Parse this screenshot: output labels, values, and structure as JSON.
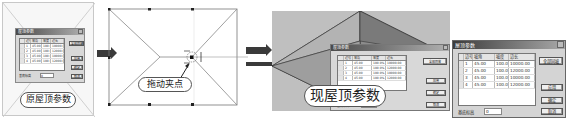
{
  "panel_original": {
    "caption": "原屋顶参数",
    "dialog": {
      "title": "屋顶参数",
      "columns": [
        "边号",
        "坡角",
        "坡度",
        "边长"
      ],
      "rows": [
        [
          "1",
          "45.00",
          "100.0%",
          "10000.00"
        ],
        [
          "2",
          "45.00",
          "100.0%",
          "12000.00"
        ],
        [
          "3",
          "45.00",
          "100.0%",
          "10000.00"
        ],
        [
          "4",
          "45.00",
          "100.0%",
          "12000.00"
        ]
      ],
      "buttons": [
        "全部同坡",
        "应用",
        "确定",
        "取消"
      ],
      "elevation_label": "基底标高",
      "elevation_value": "0"
    }
  },
  "panel_drag": {
    "caption": "拖动夹点"
  },
  "panel_current": {
    "caption": "现屋顶参数",
    "dialog": {
      "title": "屋顶参数",
      "columns": [
        "边号",
        "坡角",
        "坡度",
        "边长"
      ],
      "rows": [
        [
          "1",
          "45.00",
          "100.0%",
          "10000.00"
        ],
        [
          "2",
          "45.00",
          "100.0%",
          "12000.00"
        ],
        [
          "3",
          "45.00",
          "100.0%",
          "10000.00"
        ],
        [
          "4",
          "45.00",
          "100.0%",
          "12000.00"
        ]
      ],
      "buttons": [
        "全部同坡",
        "应用",
        "确定",
        "取消"
      ],
      "elevation_label": "基底标高",
      "elevation_value": "0"
    }
  },
  "dialog_large": {
    "title": "屋顶参数",
    "columns": [
      "边号",
      "坡角",
      "坡度",
      "边长"
    ],
    "rows": [
      [
        "1",
        "45.00",
        "100.0%",
        "10000.00"
      ],
      [
        "2",
        "45.00",
        "100.0%",
        "12000.00"
      ],
      [
        "3",
        "45.00",
        "100.0%",
        "10000.00"
      ],
      [
        "4",
        "45.00",
        "100.0%",
        "12000.00"
      ]
    ],
    "buttons": {
      "all_same_slope": "全部同坡",
      "apply": "应用",
      "ok": "确定",
      "cancel": "取消"
    },
    "elevation_label": "基底标高",
    "elevation_value": "0"
  },
  "colors": {
    "arrow": "#3a3a3a",
    "roof_light": "#a9a9a9",
    "roof_mid": "#9a9a9a",
    "roof_dark": "#7f7f7f",
    "background_3d": "#bfbfbf"
  }
}
